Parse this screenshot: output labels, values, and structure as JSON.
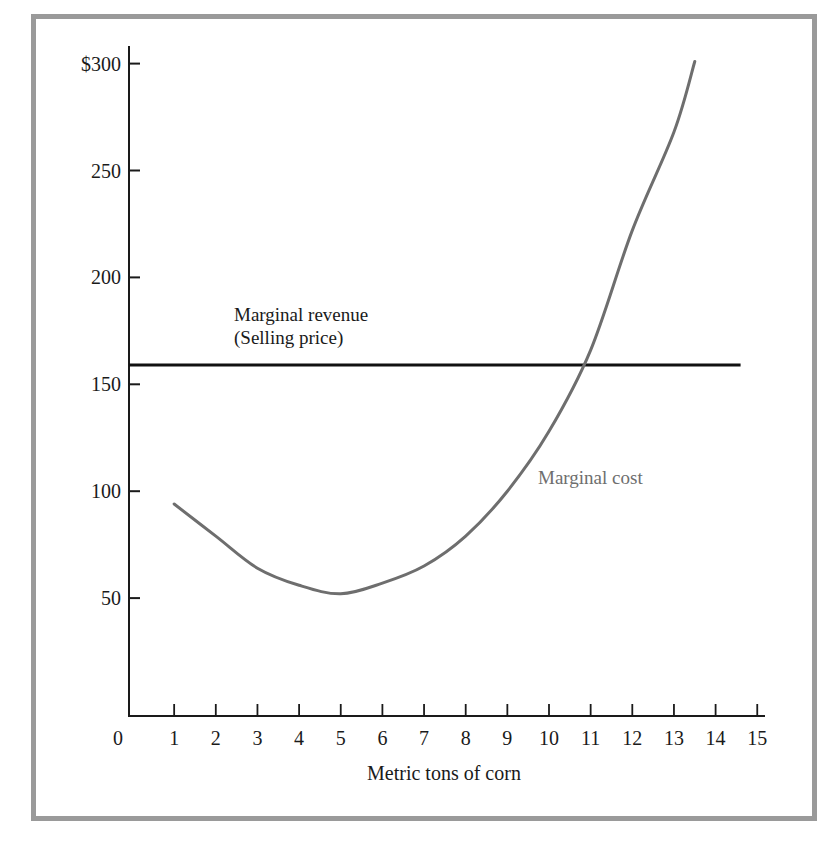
{
  "chart_data": {
    "type": "line",
    "title": "",
    "xlabel": "Metric tons of corn",
    "ylabel": "",
    "xlim": [
      0,
      15
    ],
    "ylim": [
      0,
      300
    ],
    "x_ticks": [
      "0",
      "1",
      "2",
      "3",
      "4",
      "5",
      "6",
      "7",
      "8",
      "9",
      "10",
      "11",
      "12",
      "13",
      "14",
      "15"
    ],
    "y_ticks": [
      "50",
      "100",
      "150",
      "200",
      "250",
      "$300"
    ],
    "grid": false,
    "legend": null,
    "series": [
      {
        "name": "Marginal cost",
        "color": "#6e6e6e",
        "x": [
          1,
          2,
          3,
          4,
          5,
          6,
          7,
          8,
          9,
          10,
          11,
          12,
          13,
          13.5
        ],
        "values": [
          94,
          79,
          64,
          56,
          52,
          57,
          65,
          79,
          100,
          128,
          166,
          222,
          268,
          301
        ]
      },
      {
        "name": "Marginal revenue (Selling price)",
        "color": "#111111",
        "x": [
          0,
          14.6
        ],
        "values": [
          159,
          159
        ]
      }
    ],
    "annotations": [
      {
        "text": "Marginal revenue",
        "x": 2.4,
        "y": 176
      },
      {
        "text": "(Selling price)",
        "x": 2.4,
        "y": 165
      },
      {
        "text": "Marginal cost",
        "x": 10.0,
        "y": 107
      }
    ]
  },
  "labels": {
    "origin": "0",
    "xlabel": "Metric tons of corn",
    "mr_line1": "Marginal revenue",
    "mr_line2": "(Selling price)",
    "mc": "Marginal cost"
  }
}
